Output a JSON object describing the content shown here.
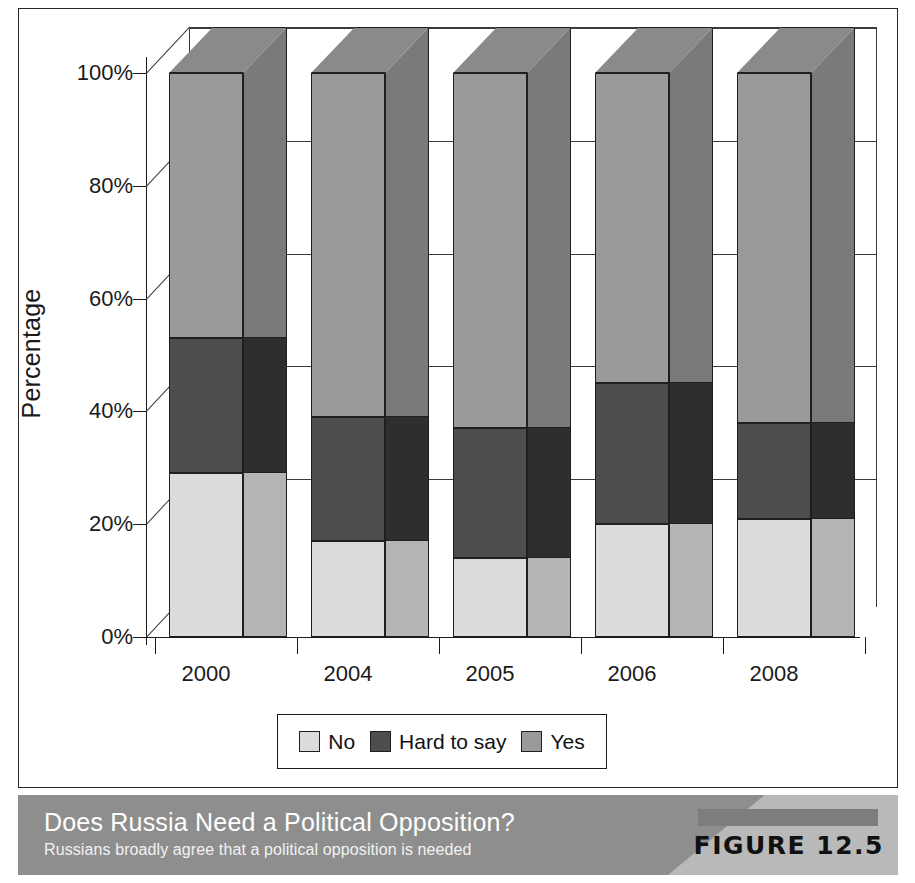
{
  "caption": {
    "title": "Does Russia Need a Political Opposition?",
    "subtitle": "Russians broadly agree that a political opposition is needed",
    "figure_tag": "FIGURE 12.5"
  },
  "legend": {
    "items": [
      {
        "label": "No",
        "color": "#dcdcdc"
      },
      {
        "label": "Hard to say",
        "color": "#4d4d4d"
      },
      {
        "label": "Yes",
        "color": "#9a9a9a"
      }
    ]
  },
  "colors": {
    "no_front": "#dcdcdc",
    "no_side": "#b5b5b5",
    "hard_front": "#4d4d4d",
    "hard_side": "#2e2e2e",
    "yes_front": "#9a9a9a",
    "yes_side": "#7a7a7a",
    "yes_top": "#8a8a8a",
    "outline": "#1f1f1f",
    "band": "#8e8e8e",
    "band_light": "#b9b9b9"
  },
  "chart_data": {
    "type": "bar",
    "subtype": "stacked-100-3d",
    "title": "Does Russia Need a Political Opposition?",
    "xlabel": "",
    "ylabel": "Percentage",
    "ylim": [
      0,
      100
    ],
    "yticks": [
      "0%",
      "20%",
      "40%",
      "60%",
      "80%",
      "100%"
    ],
    "ytick_values": [
      0,
      20,
      40,
      60,
      80,
      100
    ],
    "grid": true,
    "legend_position": "bottom",
    "categories": [
      "2000",
      "2004",
      "2005",
      "2006",
      "2008"
    ],
    "series": [
      {
        "name": "No",
        "values": [
          29,
          17,
          14,
          20,
          21
        ]
      },
      {
        "name": "Hard to say",
        "values": [
          24,
          22,
          23,
          25,
          17
        ]
      },
      {
        "name": "Yes",
        "values": [
          47,
          61,
          63,
          55,
          62
        ]
      }
    ]
  }
}
